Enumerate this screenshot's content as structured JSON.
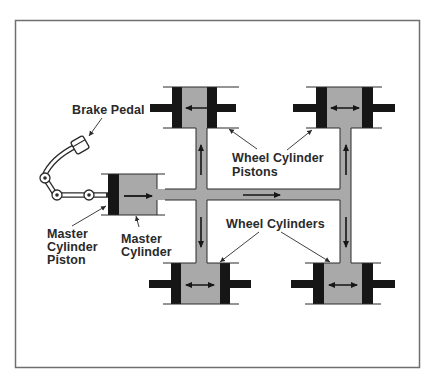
{
  "diagram": {
    "colors": {
      "frame": "#6f6f6f",
      "fluid": "#a9a9a9",
      "piston": "#161616",
      "line": "#2a2a2a",
      "background": "#ffffff"
    },
    "labels": {
      "brake_pedal": "Brake Pedal",
      "wheel_cylinder_pistons_line1": "Wheel Cylinder",
      "wheel_cylinder_pistons_line2": "Pistons",
      "wheel_cylinders": "Wheel Cylinders",
      "master_cylinder_piston_line1": "Master",
      "master_cylinder_piston_line2": "Cylinder",
      "master_cylinder_piston_line3": "Piston",
      "master_cylinder_line1": "Master",
      "master_cylinder_line2": "Cylinder"
    },
    "components": [
      {
        "name": "brake-pedal",
        "label": "Brake Pedal"
      },
      {
        "name": "master-cylinder",
        "label": "Master Cylinder"
      },
      {
        "name": "master-cylinder-piston",
        "label": "Master Cylinder Piston"
      },
      {
        "name": "wheel-cylinder-top-left",
        "label": "Wheel Cylinder"
      },
      {
        "name": "wheel-cylinder-top-right",
        "label": "Wheel Cylinder"
      },
      {
        "name": "wheel-cylinder-bottom-left",
        "label": "Wheel Cylinder"
      },
      {
        "name": "wheel-cylinder-bottom-right",
        "label": "Wheel Cylinder"
      }
    ],
    "flow_arrows": [
      {
        "location": "master-cylinder",
        "direction": "right"
      },
      {
        "location": "main-line",
        "direction": "right"
      },
      {
        "location": "left-riser-up",
        "direction": "up"
      },
      {
        "location": "right-riser-up",
        "direction": "up"
      },
      {
        "location": "left-riser-down",
        "direction": "down"
      },
      {
        "location": "right-riser-down",
        "direction": "down"
      },
      {
        "location": "wheel-cylinders",
        "direction": "both"
      }
    ]
  }
}
